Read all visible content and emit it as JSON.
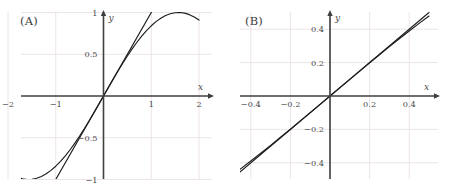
{
  "figure": {
    "panels": [
      {
        "tag": "(A)",
        "axis_labels": {
          "x": "x",
          "y": "y"
        },
        "x_ticks": [
          {
            "value": -2,
            "label": "−2"
          },
          {
            "value": -1,
            "label": "−1"
          },
          {
            "value": 1,
            "label": "1"
          },
          {
            "value": 2,
            "label": "2"
          }
        ],
        "y_ticks": [
          {
            "value": 1,
            "label": "1"
          },
          {
            "value": 0.5,
            "label": "0.5"
          },
          {
            "value": -0.5,
            "label": "−0.5"
          },
          {
            "value": -1,
            "label": "−1"
          }
        ]
      },
      {
        "tag": "(B)",
        "axis_labels": {
          "x": "x",
          "y": "y"
        },
        "x_ticks": [
          {
            "value": -0.4,
            "label": "−0.4"
          },
          {
            "value": -0.2,
            "label": "−0.2"
          },
          {
            "value": 0.2,
            "label": "0.2"
          },
          {
            "value": 0.4,
            "label": "0.4"
          }
        ],
        "y_ticks": [
          {
            "value": 0.4,
            "label": "0.4"
          },
          {
            "value": 0.2,
            "label": "0.2"
          },
          {
            "value": -0.2,
            "label": "−0.2"
          },
          {
            "value": -0.4,
            "label": "−0.4"
          }
        ]
      }
    ]
  },
  "colors": {
    "background": "#ffffff",
    "grid": "#ece4e6",
    "axis": "#3f3f3f",
    "curve": "#1d1d1d",
    "tangent": "#1d1d1d",
    "text": "#4a4a4a"
  },
  "chart_data": [
    {
      "type": "line",
      "title": "(A)",
      "xlabel": "x",
      "ylabel": "y",
      "xlim": [
        -2,
        2
      ],
      "ylim": [
        -1,
        1
      ],
      "grid": true,
      "legend": "none",
      "xticks": [
        -2,
        -1,
        1,
        2
      ],
      "yticks": [
        -1,
        -0.5,
        0.5,
        1
      ],
      "series": [
        {
          "name": "sin(x)",
          "expression": "y = sin(x)",
          "x": [
            -2,
            -1.9,
            -1.8,
            -1.7,
            -1.6,
            -1.5,
            -1.4,
            -1.3,
            -1.2,
            -1.1,
            -1,
            -0.9,
            -0.8,
            -0.7,
            -0.6,
            -0.5,
            -0.4,
            -0.3,
            -0.2,
            -0.1,
            0,
            0.1,
            0.2,
            0.3,
            0.4,
            0.5,
            0.6,
            0.7,
            0.8,
            0.9,
            1,
            1.1,
            1.2,
            1.3,
            1.4,
            1.5,
            1.6,
            1.7,
            1.8,
            1.9,
            2
          ],
          "y": [
            -0.909,
            -0.946,
            -0.974,
            -0.992,
            -1.0,
            -0.997,
            -0.985,
            -0.964,
            -0.932,
            -0.891,
            -0.841,
            -0.783,
            -0.717,
            -0.644,
            -0.565,
            -0.479,
            -0.389,
            -0.296,
            -0.199,
            -0.1,
            0,
            0.1,
            0.199,
            0.296,
            0.389,
            0.479,
            0.565,
            0.644,
            0.717,
            0.783,
            0.841,
            0.891,
            0.932,
            0.964,
            0.985,
            0.997,
            1.0,
            0.992,
            0.974,
            0.946,
            0.909
          ]
        },
        {
          "name": "tangent at 0",
          "expression": "y = x",
          "x": [
            -1.05,
            1.05
          ],
          "y": [
            -1.05,
            1.05
          ]
        }
      ]
    },
    {
      "type": "line",
      "title": "(B)",
      "xlabel": "x",
      "ylabel": "y",
      "xlim": [
        -0.5,
        0.5
      ],
      "ylim": [
        -0.5,
        0.5
      ],
      "grid": true,
      "legend": "none",
      "xticks": [
        -0.4,
        -0.2,
        0.2,
        0.4
      ],
      "yticks": [
        -0.4,
        -0.2,
        0.2,
        0.4
      ],
      "series": [
        {
          "name": "sin(x)",
          "expression": "y = sin(x)",
          "x": [
            -0.5,
            -0.45,
            -0.4,
            -0.35,
            -0.3,
            -0.25,
            -0.2,
            -0.15,
            -0.1,
            -0.05,
            0,
            0.05,
            0.1,
            0.15,
            0.2,
            0.25,
            0.3,
            0.35,
            0.4,
            0.45,
            0.5
          ],
          "y": [
            -0.479,
            -0.435,
            -0.389,
            -0.343,
            -0.296,
            -0.247,
            -0.199,
            -0.149,
            -0.0998,
            -0.05,
            0,
            0.05,
            0.0998,
            0.149,
            0.199,
            0.247,
            0.296,
            0.343,
            0.389,
            0.435,
            0.479
          ]
        },
        {
          "name": "tangent at 0",
          "expression": "y = x",
          "x": [
            -0.5,
            0.5
          ],
          "y": [
            -0.5,
            0.5
          ]
        }
      ]
    }
  ]
}
